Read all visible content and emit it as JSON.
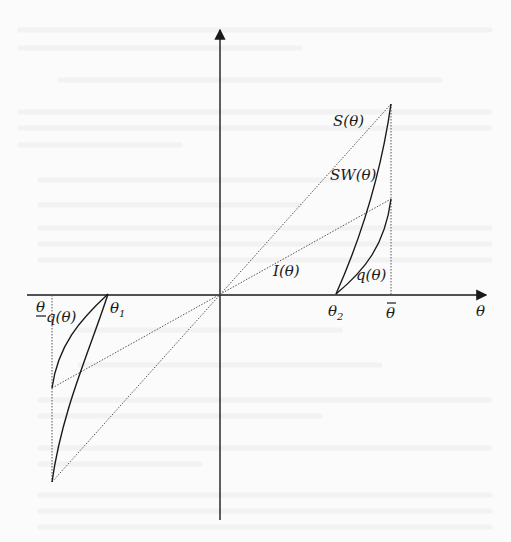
{
  "diagram": {
    "type": "economic-schedule-diagram",
    "axes": {
      "x_label": "θ",
      "y_axis_label": "",
      "origin": [
        220,
        295
      ]
    },
    "x_axis_marks": [
      {
        "id": "theta_lower",
        "label": "θ",
        "decoration": "underline",
        "x": 52
      },
      {
        "id": "theta_1",
        "label": "θ",
        "subscript": "1",
        "x": 108
      },
      {
        "id": "theta_2",
        "label": "θ",
        "subscript": "2",
        "x": 336
      },
      {
        "id": "theta_upper",
        "label": "θ",
        "decoration": "overbar",
        "x": 391
      }
    ],
    "curves": [
      {
        "id": "S",
        "label": "S(θ)",
        "style": "dotted",
        "kind": "line"
      },
      {
        "id": "I",
        "label": "I(θ)",
        "style": "dotted",
        "kind": "line"
      },
      {
        "id": "SW_right",
        "label": "SW(θ)",
        "style": "solid",
        "kind": "curve"
      },
      {
        "id": "q_right",
        "label": "q(θ)",
        "style": "solid",
        "kind": "curve"
      },
      {
        "id": "q_left",
        "label": "q(θ)",
        "style": "solid",
        "kind": "curve"
      },
      {
        "id": "SW_left",
        "label": "",
        "style": "solid",
        "kind": "curve"
      }
    ],
    "labels": {
      "S": "S(θ)",
      "SW": "SW(θ)",
      "I": "I(θ)",
      "q_right": "q(θ)",
      "q_left": "q(θ)",
      "theta_axis": "θ",
      "theta_lower": "θ",
      "theta_1": "θ",
      "theta_1_sub": "1",
      "theta_2": "θ",
      "theta_2_sub": "2",
      "theta_upper": "θ"
    },
    "colors": {
      "ink": "#1a1a1a",
      "dotted": "#555555",
      "background": "#fbfbfb"
    }
  }
}
